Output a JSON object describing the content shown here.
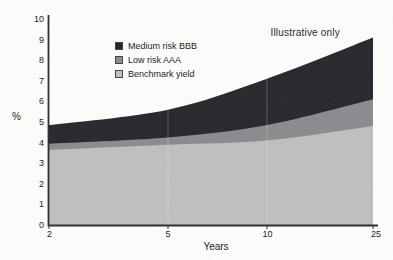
{
  "figure": {
    "annotation": "Illustrative only",
    "xlabel": "Years",
    "ylabel": "%"
  },
  "legend": [
    {
      "label": "Medium risk BBB",
      "color": "#26262d"
    },
    {
      "label": "Low risk AAA",
      "color": "#8b8b8f"
    },
    {
      "label": "Benchmark yield",
      "color": "#bfbfbf"
    }
  ],
  "chart_data": {
    "type": "area",
    "stacked": true,
    "x": [
      2,
      5,
      10,
      25
    ],
    "x_tick_labels": [
      "2",
      "5",
      "10",
      "25"
    ],
    "series": [
      {
        "name": "Benchmark yield",
        "color": "#bfbfbf",
        "values": [
          3.65,
          3.9,
          4.1,
          4.8
        ]
      },
      {
        "name": "Low risk AAA",
        "color": "#8b8b8f",
        "values": [
          0.3,
          0.35,
          0.75,
          1.3
        ]
      },
      {
        "name": "Medium risk BBB",
        "color": "#26262d",
        "values": [
          0.9,
          1.35,
          2.25,
          3.0
        ]
      }
    ],
    "cumulative_tops": {
      "benchmark_yield": [
        3.65,
        3.9,
        4.1,
        4.8
      ],
      "low_risk_aaa": [
        3.95,
        4.25,
        4.85,
        6.1
      ],
      "medium_risk_bbb": [
        4.85,
        5.6,
        7.1,
        9.1
      ]
    },
    "title": "",
    "xlabel": "Years",
    "ylabel": "%",
    "ylim": [
      0,
      10
    ],
    "y_ticks": [
      0,
      1,
      2,
      3,
      4,
      5,
      6,
      7,
      8,
      9,
      10
    ],
    "grid": "faint vertical lines at x ticks",
    "legend_position": "upper-left inside plot",
    "annotation": "Illustrative only",
    "axis_color": "#2d2d2d"
  }
}
